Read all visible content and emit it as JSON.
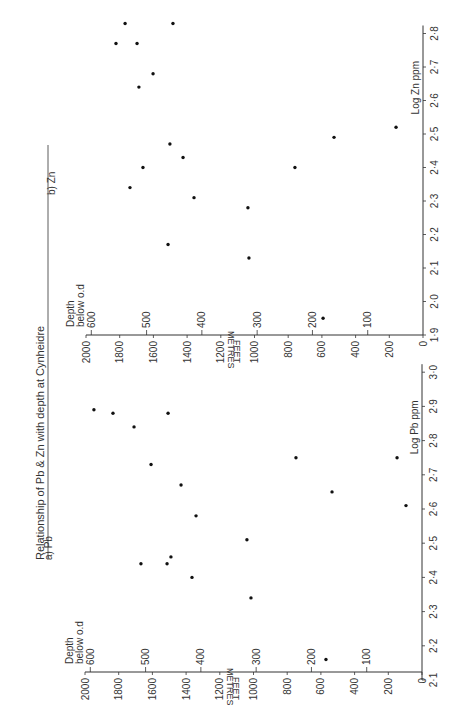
{
  "title": "Relationship of Pb & Zn with depth at Cynheidre",
  "chart_data": [
    {
      "type": "scatter",
      "panel_label": "b) Zn",
      "title": "Relationship of Pb & Zn with depth at Cynheidre",
      "xlabel": "Log Zn ppm",
      "ylabel": "Depth below o.d",
      "y_unit_primary": "FEET",
      "y_unit_secondary": "METRES",
      "x_ticks": [
        "1.9",
        "2.0",
        "2.1",
        "2.2",
        "2.3",
        "2.4",
        "2.5",
        "2.6",
        "2.7",
        "2.8"
      ],
      "feet_ticks": [
        "0",
        "200",
        "400",
        "600",
        "800",
        "1000",
        "1200",
        "1400",
        "1600",
        "1800",
        "2000"
      ],
      "metre_ticks": [
        "100",
        "200",
        "300",
        "400",
        "500",
        "600"
      ],
      "xlim": [
        1.9,
        2.85
      ],
      "ylim_feet": [
        0,
        2000
      ],
      "points": [
        {
          "log_ppm": 2.83,
          "depth_ft": 1768
        },
        {
          "log_ppm": 2.83,
          "depth_ft": 1484
        },
        {
          "log_ppm": 2.77,
          "depth_ft": 1822
        },
        {
          "log_ppm": 2.77,
          "depth_ft": 1697
        },
        {
          "log_ppm": 2.68,
          "depth_ft": 1602
        },
        {
          "log_ppm": 2.64,
          "depth_ft": 1686
        },
        {
          "log_ppm": 2.47,
          "depth_ft": 1502
        },
        {
          "log_ppm": 2.43,
          "depth_ft": 1424
        },
        {
          "log_ppm": 2.4,
          "depth_ft": 1662
        },
        {
          "log_ppm": 2.34,
          "depth_ft": 1739
        },
        {
          "log_ppm": 2.31,
          "depth_ft": 1359
        },
        {
          "log_ppm": 2.17,
          "depth_ft": 1513
        },
        {
          "log_ppm": 2.13,
          "depth_ft": 1033
        },
        {
          "log_ppm": 2.28,
          "depth_ft": 1039
        },
        {
          "log_ppm": 2.4,
          "depth_ft": 760
        },
        {
          "log_ppm": 2.49,
          "depth_ft": 528
        },
        {
          "log_ppm": 2.52,
          "depth_ft": 160
        },
        {
          "log_ppm": 1.95,
          "depth_ft": 593
        }
      ]
    },
    {
      "type": "scatter",
      "panel_label": "a) Pb",
      "title": "Relationship of Pb & Zn with depth at Cynheidre",
      "xlabel": "Log Pb ppm",
      "ylabel": "Depth below o.d",
      "y_unit_primary": "FEET",
      "y_unit_secondary": "METRES",
      "x_ticks": [
        "2.1",
        "2.2",
        "2.3",
        "2.4",
        "2.5",
        "2.6",
        "2.7",
        "2.8",
        "2.9",
        "3.0"
      ],
      "feet_ticks": [
        "0",
        "200",
        "400",
        "600",
        "800",
        "1000",
        "1200",
        "1400",
        "1600",
        "1800",
        "2000"
      ],
      "metre_ticks": [
        "100",
        "200",
        "300",
        "400",
        "500",
        "600"
      ],
      "xlim": [
        2.1,
        3.0
      ],
      "ylim_feet": [
        0,
        2000
      ],
      "points": [
        {
          "log_ppm": 2.89,
          "depth_ft": 1947
        },
        {
          "log_ppm": 2.88,
          "depth_ft": 1834
        },
        {
          "log_ppm": 2.84,
          "depth_ft": 1709
        },
        {
          "log_ppm": 2.88,
          "depth_ft": 1507
        },
        {
          "log_ppm": 2.73,
          "depth_ft": 1608
        },
        {
          "log_ppm": 2.67,
          "depth_ft": 1430
        },
        {
          "log_ppm": 2.58,
          "depth_ft": 1341
        },
        {
          "log_ppm": 2.44,
          "depth_ft": 1668
        },
        {
          "log_ppm": 2.44,
          "depth_ft": 1513
        },
        {
          "log_ppm": 2.46,
          "depth_ft": 1490
        },
        {
          "log_ppm": 2.4,
          "depth_ft": 1365
        },
        {
          "log_ppm": 2.51,
          "depth_ft": 1039
        },
        {
          "log_ppm": 2.34,
          "depth_ft": 1015
        },
        {
          "log_ppm": 2.75,
          "depth_ft": 748
        },
        {
          "log_ppm": 2.65,
          "depth_ft": 534
        },
        {
          "log_ppm": 2.75,
          "depth_ft": 148
        },
        {
          "log_ppm": 2.61,
          "depth_ft": 95
        },
        {
          "log_ppm": 2.16,
          "depth_ft": 570
        }
      ]
    }
  ]
}
